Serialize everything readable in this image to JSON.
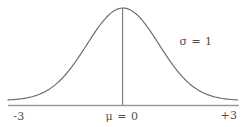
{
  "figure": {
    "type": "normal-distribution-diagram",
    "curve": {
      "distribution": "normal",
      "mu": 0,
      "sigma": 1,
      "x_range": [
        -3,
        3
      ]
    },
    "labels": {
      "sigma_annotation": "σ = 1",
      "mean_label": "μ = 0",
      "left_axis_tick": "-3",
      "right_axis_tick": "+3"
    },
    "colors": {
      "curve_stroke": "#6e6e6e",
      "axis_stroke": "#9a9a9a",
      "center_line_stroke": "#767676",
      "label_text": "#4f4f4f",
      "background": "#ffffff"
    }
  }
}
